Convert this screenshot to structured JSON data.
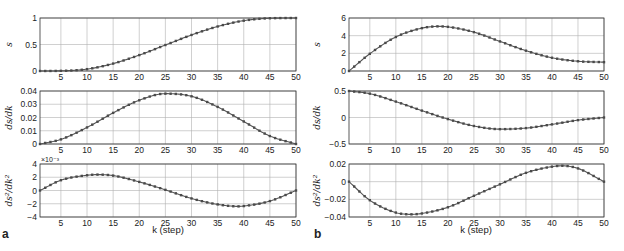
{
  "figure": {
    "panel_labels": [
      "a",
      "b"
    ],
    "xlabel": "k (step)"
  },
  "chart_data": [
    {
      "type": "line",
      "panel": "a",
      "row": 0,
      "ylabel": "s",
      "xlabel": "",
      "xlim": [
        1,
        50
      ],
      "ylim": [
        0,
        1
      ],
      "xticks": [
        5,
        10,
        15,
        20,
        25,
        30,
        35,
        40,
        45,
        50
      ],
      "yticks": [
        0,
        0.5,
        1
      ],
      "ytick_labels": [
        "0",
        "0.5",
        "1"
      ],
      "grid": true,
      "markers": true,
      "x": [
        1,
        5,
        10,
        15,
        20,
        25,
        30,
        35,
        40,
        45,
        50
      ],
      "values": [
        0,
        0.003,
        0.035,
        0.14,
        0.3,
        0.49,
        0.68,
        0.84,
        0.95,
        0.995,
        1.0
      ]
    },
    {
      "type": "line",
      "panel": "a",
      "row": 1,
      "ylabel": "ds/dk",
      "xlim": [
        1,
        50
      ],
      "ylim": [
        0,
        0.04
      ],
      "xticks": [
        5,
        10,
        15,
        20,
        25,
        30,
        35,
        40,
        45,
        50
      ],
      "yticks": [
        0,
        0.01,
        0.02,
        0.03,
        0.04
      ],
      "ytick_labels": [
        "0",
        "0.01",
        "0.02",
        "0.03",
        "0.04"
      ],
      "grid": true,
      "markers": true,
      "x": [
        1,
        5,
        10,
        15,
        20,
        25,
        30,
        35,
        40,
        45,
        50
      ],
      "values": [
        0,
        0.0035,
        0.0125,
        0.0235,
        0.033,
        0.038,
        0.036,
        0.028,
        0.017,
        0.006,
        0
      ]
    },
    {
      "type": "line",
      "panel": "a",
      "row": 2,
      "ylabel": "ds²/dk²",
      "exponent_label": "×10⁻³",
      "xlim": [
        1,
        50
      ],
      "ylim": [
        -4,
        4
      ],
      "xticks": [
        5,
        10,
        15,
        20,
        25,
        30,
        35,
        40,
        45,
        50
      ],
      "yticks": [
        -4,
        -2,
        0,
        2,
        4
      ],
      "ytick_labels": [
        "−4",
        "−2",
        "0",
        "2",
        "4"
      ],
      "grid": true,
      "markers": true,
      "x": [
        1,
        5,
        10,
        12,
        15,
        20,
        25,
        30,
        35,
        39,
        40,
        45,
        50
      ],
      "values": [
        0,
        1.55,
        2.3,
        2.4,
        2.25,
        1.3,
        0.1,
        -1.2,
        -2.1,
        -2.4,
        -2.35,
        -1.6,
        0
      ]
    },
    {
      "type": "line",
      "panel": "b",
      "row": 0,
      "ylabel": "s",
      "xlim": [
        1,
        50
      ],
      "ylim": [
        0,
        6
      ],
      "xticks": [
        5,
        10,
        15,
        20,
        25,
        30,
        35,
        40,
        45,
        50
      ],
      "yticks": [
        0,
        2,
        4,
        6
      ],
      "ytick_labels": [
        "0",
        "2",
        "4",
        "6"
      ],
      "grid": true,
      "markers": true,
      "x": [
        1,
        5,
        10,
        15,
        18,
        20,
        25,
        30,
        35,
        40,
        45,
        50
      ],
      "values": [
        0,
        1.95,
        3.85,
        4.85,
        5.05,
        5.0,
        4.4,
        3.35,
        2.3,
        1.5,
        1.1,
        1.0
      ]
    },
    {
      "type": "line",
      "panel": "b",
      "row": 1,
      "ylabel": "ds/dk",
      "xlim": [
        1,
        50
      ],
      "ylim": [
        -0.5,
        0.5
      ],
      "xticks": [
        5,
        10,
        15,
        20,
        25,
        30,
        35,
        40,
        45,
        50
      ],
      "yticks": [
        -0.5,
        0,
        0.5
      ],
      "ytick_labels": [
        "−0.5",
        "0",
        "0.5"
      ],
      "grid": true,
      "markers": true,
      "x": [
        1,
        5,
        10,
        15,
        20,
        25,
        30,
        35,
        40,
        45,
        50
      ],
      "values": [
        0.5,
        0.45,
        0.3,
        0.13,
        -0.03,
        -0.16,
        -0.22,
        -0.2,
        -0.13,
        -0.05,
        0
      ]
    },
    {
      "type": "line",
      "panel": "b",
      "row": 2,
      "ylabel": "ds²/dk²",
      "xlim": [
        1,
        50
      ],
      "ylim": [
        -0.04,
        0.02
      ],
      "xticks": [
        5,
        10,
        15,
        20,
        25,
        30,
        35,
        40,
        45,
        50
      ],
      "yticks": [
        -0.04,
        -0.02,
        0,
        0.02
      ],
      "ytick_labels": [
        "−0.04",
        "−0.02",
        "0",
        "0.02"
      ],
      "grid": true,
      "markers": true,
      "x": [
        1,
        5,
        10,
        13,
        15,
        20,
        25,
        30,
        35,
        40,
        42,
        45,
        50
      ],
      "values": [
        0,
        -0.021,
        -0.035,
        -0.037,
        -0.036,
        -0.029,
        -0.016,
        -0.003,
        0.01,
        0.017,
        0.018,
        0.015,
        0
      ]
    }
  ],
  "style": {
    "line_color": "#555555",
    "marker_color": "#4a4a4a",
    "grid_color": "#b0b0b0",
    "frame_color": "#333333"
  }
}
